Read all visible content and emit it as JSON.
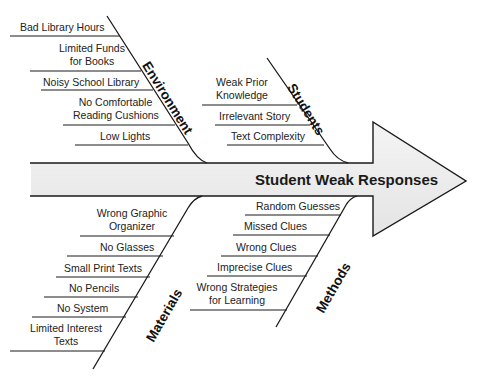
{
  "diagram": {
    "type": "fishbone",
    "effect": "Student Weak Responses",
    "colors": {
      "arrow_fill": "#ebebeb",
      "line": "#1a1a1a",
      "text": "#222222"
    },
    "categories": {
      "environment": {
        "label": "Environment",
        "causes": [
          "Bad Library Hours",
          "Limited Funds for Books",
          "Noisy School Library",
          "No Comfortable Reading Cushions",
          "Low Lights"
        ]
      },
      "students": {
        "label": "Students",
        "causes": [
          "Weak Prior Knowledge",
          "Irrelevant Story",
          "Text Complexity"
        ]
      },
      "materials": {
        "label": "Materials",
        "causes": [
          "Wrong Graphic Organizer",
          "No Glasses",
          "Small Print Texts",
          "No Pencils",
          "No System",
          "Limited Interest Texts"
        ]
      },
      "methods": {
        "label": "Methods",
        "causes": [
          "Random Guesses",
          "Missed Clues",
          "Wrong Clues",
          "Imprecise Clues",
          "Wrong Strategies for Learning"
        ]
      }
    },
    "display_lines": {
      "env": [
        "Bad Library Hours",
        "Limited Funds",
        "for Books",
        "Noisy School Library",
        "No Comfortable",
        "Reading Cushions",
        "Low Lights"
      ],
      "stu": [
        "Weak Prior",
        "Knowledge",
        "Irrelevant Story",
        "Text Complexity"
      ],
      "mat": [
        "Wrong Graphic",
        "Organizer",
        "No Glasses",
        "Small Print Texts",
        "No Pencils",
        "No System",
        "Limited Interest",
        "Texts"
      ],
      "met": [
        "Random Guesses",
        "Missed Clues",
        "Wrong Clues",
        "Imprecise Clues",
        "Wrong Strategies",
        "for Learning"
      ]
    }
  }
}
